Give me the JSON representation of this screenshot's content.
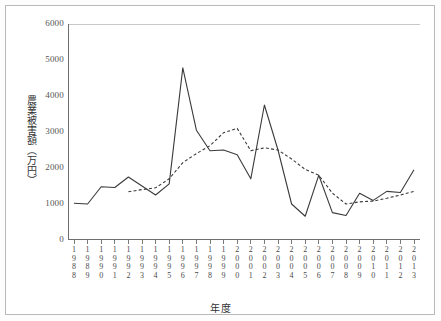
{
  "chart_data": {
    "type": "line",
    "title": "",
    "xlabel": "年度",
    "ylabel": "農業被害額（万円）",
    "ylim": [
      0,
      6000
    ],
    "ytick_values": [
      0,
      1000,
      2000,
      3000,
      4000,
      5000,
      6000
    ],
    "ytick_labels": [
      "0",
      "1000",
      "2000",
      "3000",
      "4000",
      "5000",
      "6000"
    ],
    "grid": "top-only",
    "legend": "none",
    "categories": [
      "1988",
      "1989",
      "1990",
      "1991",
      "1992",
      "1993",
      "1994",
      "1995",
      "1996",
      "1997",
      "1998",
      "1999",
      "2000",
      "2001",
      "2002",
      "2003",
      "2004",
      "2005",
      "2006",
      "2007",
      "2008",
      "2009",
      "2010",
      "2011",
      "2012",
      "2013"
    ],
    "series": [
      {
        "name": "農業被害額（実績）",
        "style": "solid",
        "color": "#3a3a3a",
        "values": [
          1020,
          1000,
          1480,
          1460,
          1750,
          1500,
          1250,
          1560,
          4780,
          3050,
          2480,
          2500,
          2370,
          1700,
          3750,
          2500,
          1000,
          660,
          1800,
          760,
          680,
          1300,
          1100,
          1350,
          1320,
          1950
        ]
      },
      {
        "name": "移動平均",
        "style": "dashed",
        "color": "#3a3a3a",
        "values": [
          null,
          null,
          null,
          null,
          1340,
          1400,
          1450,
          1700,
          2150,
          2400,
          2620,
          2980,
          3100,
          2480,
          2560,
          2500,
          2250,
          1960,
          1800,
          1300,
          1000,
          1060,
          1080,
          1160,
          1250,
          1350
        ]
      }
    ]
  },
  "axis": {
    "x_title": "年度",
    "y_title_chars": "農業被害額（万円）"
  }
}
